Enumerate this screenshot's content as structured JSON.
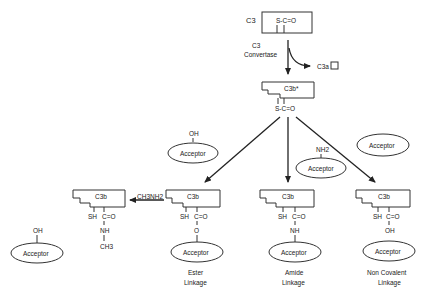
{
  "diagram": {
    "c3": {
      "label": "C3",
      "bond": "S-C=O"
    },
    "convertase": {
      "line1": "C3",
      "line2": "Convertase"
    },
    "c3a": {
      "label": "C3a",
      "symbol": "□"
    },
    "c3b_active": {
      "label": "C3b*",
      "bond": "S-C=O"
    },
    "free_acceptors": [
      {
        "group": "OH",
        "label": "Acceptor"
      },
      {
        "group": "NH2",
        "label": "Acceptor"
      },
      {
        "group": "",
        "label": "Acceptor"
      },
      {
        "group": "OH",
        "label": "Acceptor"
      }
    ],
    "methylamine": {
      "reagent": "CH3NH2",
      "product_label": "C3b",
      "sh": "SH",
      "carbonyl": "C=O",
      "link": "NH",
      "terminal": "CH3"
    },
    "products": [
      {
        "label": "C3b",
        "sh": "SH",
        "carbonyl": "C=O",
        "link": "O",
        "acceptor": "Acceptor",
        "caption1": "Ester",
        "caption2": "Linkage"
      },
      {
        "label": "C3b",
        "sh": "SH",
        "carbonyl": "C=O",
        "link": "NH",
        "acceptor": "Acceptor",
        "caption1": "Amide",
        "caption2": "Linkage"
      },
      {
        "label": "C3b",
        "sh": "SH",
        "carbonyl": "C=O",
        "link": "OH",
        "acceptor": "Acceptor",
        "caption1": "Non Covalent",
        "caption2": "Linkage"
      }
    ]
  }
}
